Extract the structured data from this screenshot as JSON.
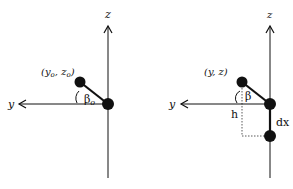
{
  "diagrams": [
    {
      "name": "initial-position",
      "axis_labels": {
        "vertical": "z",
        "horizontal": "y"
      },
      "point_label": "(y₀, z₀)",
      "point_label_parts": {
        "open": "(y",
        "sub1": "o",
        "mid": ", z",
        "sub2": "o",
        "close": ")"
      },
      "angle_label": "β",
      "angle_sub": "o"
    },
    {
      "name": "displaced-position",
      "axis_labels": {
        "vertical": "z",
        "horizontal": "y"
      },
      "point_label": "(y, z)",
      "angle_label": "β",
      "height_label": "h",
      "displacement_label": "dx"
    }
  ],
  "colors": {
    "ink": "#111111",
    "background": "#ffffff"
  }
}
